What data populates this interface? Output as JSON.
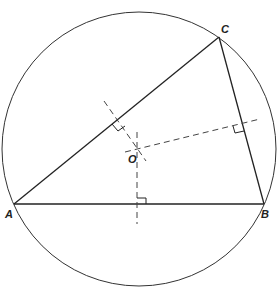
{
  "diagram": {
    "circle": {
      "cx": 139,
      "cy": 149,
      "r": 137
    },
    "points": {
      "A": {
        "label": "A",
        "x": 14,
        "y": 204
      },
      "B": {
        "label": "B",
        "x": 264,
        "y": 204
      },
      "C": {
        "label": "C",
        "x": 219,
        "y": 37
      },
      "O": {
        "label": "O",
        "x": 139,
        "y": 149
      }
    },
    "perpendicular_bisectors": [
      "AB",
      "BC",
      "CA"
    ],
    "colors": {
      "line": "#222222",
      "dash": "#444444"
    }
  }
}
